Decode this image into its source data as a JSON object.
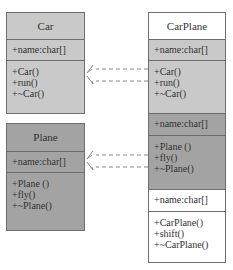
{
  "diagram": {
    "type": "uml-class-diagram",
    "colors": {
      "car_fill": "#c9c9c9",
      "plane_fill": "#a3a3a3",
      "white_fill": "#ffffff",
      "border": "#6e6e6e",
      "arrow": "#8a8a8a"
    },
    "classes": {
      "car": {
        "name": "Car",
        "attributes": [
          "+name:char[]"
        ],
        "methods": [
          "+Car()",
          "+run()",
          "+~Car()"
        ]
      },
      "plane": {
        "name": "Plane",
        "attributes": [
          "+name:char[]"
        ],
        "methods": [
          "+Plane ()",
          "+fly()",
          "+~Plane()"
        ]
      },
      "carplane": {
        "name": "CarPlane",
        "inherited_car_attributes": [
          "+name:char[]"
        ],
        "inherited_car_methods": [
          "+Car()",
          "+run()",
          "+~Car()"
        ],
        "inherited_plane_attributes": [
          "+name:char[]"
        ],
        "inherited_plane_methods": [
          "+Plane ()",
          "+fly()",
          "+~Plane()"
        ],
        "attributes": [
          "+name:char[]"
        ],
        "methods": [
          "+CarPlane()",
          "+shift()",
          "+~CarPlane()"
        ]
      }
    },
    "relations": [
      {
        "from": "CarPlane",
        "to": "Car",
        "style": "dashed",
        "count": 2
      },
      {
        "from": "CarPlane",
        "to": "Plane",
        "style": "dashed",
        "count": 2
      }
    ]
  }
}
